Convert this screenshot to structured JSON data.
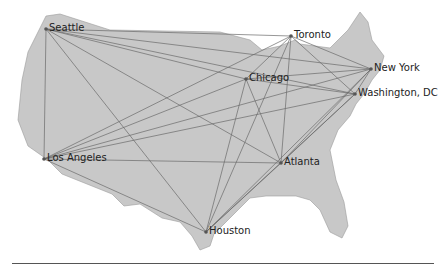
{
  "diagram": {
    "type": "network-map",
    "region": "United States",
    "colors": {
      "land": "#c8c8c8",
      "edge": "#6a6a6a",
      "node": "#555555",
      "label": "#222222"
    },
    "nodes": [
      {
        "id": "seattle",
        "label": "Seattle",
        "x": 46,
        "y": 29
      },
      {
        "id": "toronto",
        "label": "Toronto",
        "x": 291,
        "y": 36
      },
      {
        "id": "chicago",
        "label": "Chicago",
        "x": 246,
        "y": 79
      },
      {
        "id": "newyork",
        "label": "New York",
        "x": 371,
        "y": 69
      },
      {
        "id": "washington",
        "label": "Washington, DC",
        "x": 355,
        "y": 94
      },
      {
        "id": "losangeles",
        "label": "Los Angeles",
        "x": 44,
        "y": 159
      },
      {
        "id": "atlanta",
        "label": "Atlanta",
        "x": 281,
        "y": 163
      },
      {
        "id": "houston",
        "label": "Houston",
        "x": 206,
        "y": 232
      }
    ],
    "edges": "complete graph between all cities"
  }
}
